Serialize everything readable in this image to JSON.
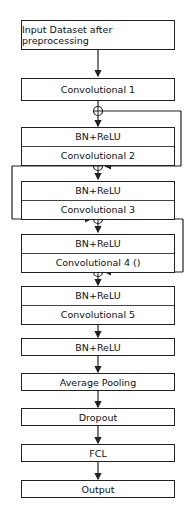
{
  "diagram": {
    "title": "",
    "nodes": [
      {
        "id": "input",
        "label": "Input Dataset after preprocessing"
      },
      {
        "id": "conv1",
        "label": "Convolutional 1"
      },
      {
        "id": "block2",
        "top": "BN+ReLU",
        "bottom": "Convolutional 2"
      },
      {
        "id": "block3",
        "top": "BN+ReLU",
        "bottom": "Convolutional 3"
      },
      {
        "id": "block4",
        "top": "BN+ReLU",
        "bottom": "Convolutional 4 ()"
      },
      {
        "id": "block5",
        "top": "BN+ReLU",
        "bottom": "Convolutional 5"
      },
      {
        "id": "bnrelu",
        "label": "BN+ReLU"
      },
      {
        "id": "avgpool",
        "label": "Average Pooling"
      },
      {
        "id": "dropout",
        "label": "Dropout"
      },
      {
        "id": "fcl",
        "label": "FCL"
      },
      {
        "id": "output",
        "label": "Output"
      }
    ],
    "add_symbol": "⊕",
    "colors": {
      "line": "#222222",
      "background": "#ffffff"
    }
  }
}
